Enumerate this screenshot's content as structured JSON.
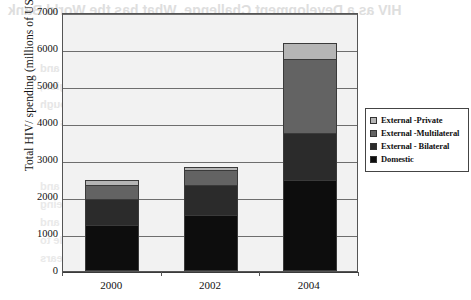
{
  "chart_data": {
    "type": "bar",
    "subtype": "stacked-vertical",
    "title": "",
    "xlabel": "",
    "ylabel": "Total HIV/ spending (millions of US dollar)",
    "categories": [
      "2000",
      "2002",
      "2004"
    ],
    "ylim": [
      0,
      7000
    ],
    "yticks": [
      0,
      1000,
      2000,
      3000,
      4000,
      5000,
      6000,
      7000
    ],
    "ytick_labels": [
      "0",
      "1000",
      "2000",
      "3000",
      "4000",
      "5000",
      "6000",
      "7000"
    ],
    "grid": true,
    "grid_axis": "y",
    "legend_position": "right",
    "series": [
      {
        "name": "Domestic",
        "color": "#0d0d0d",
        "values": [
          1250,
          1520,
          2460
        ]
      },
      {
        "name": "External - Bilateral",
        "color": "#2b2b2b",
        "values": [
          720,
          830,
          1270
        ]
      },
      {
        "name": "External -Multilateral",
        "color": "#636363",
        "values": [
          370,
          410,
          2030
        ]
      },
      {
        "name": "External -Private",
        "color": "#b5b5b5",
        "values": [
          110,
          60,
          410
        ]
      }
    ],
    "totals": [
      2450,
      2820,
      6170
    ],
    "plot_background": "#f2f2f2",
    "frame_color": "#555555"
  },
  "legend": {
    "items": [
      {
        "label": "External -Private",
        "swatch": "#b5b5b5"
      },
      {
        "label": "External -Multilateral",
        "swatch": "#636363"
      },
      {
        "label": "External - Bilateral",
        "swatch": "#2b2b2b"
      },
      {
        "label": "Domestic",
        "swatch": "#0d0d0d"
      }
    ]
  },
  "page_bleed": {
    "lines": [
      "HIV as a Development Challenge, What has the World Bank",
      "to say?",
      "done some studies on HIV prevalence and",
      "the impact on the economy of the region,",
      "and how to address the epidemic through",
      "a multi sector response in various countries",
      "through the years of the epidemic and",
      "with the resources available and being",
      "mobilized the response has grown and",
      "the international community has a role to",
      "continue support in the coming years"
    ]
  }
}
